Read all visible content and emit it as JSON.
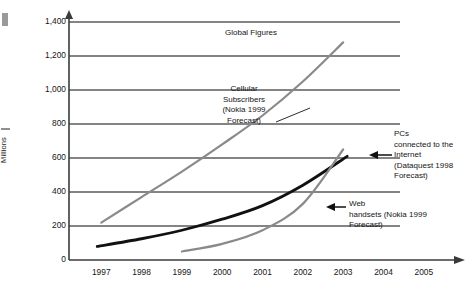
{
  "chart_data": {
    "type": "line",
    "title": "Global Figures",
    "xlabel": "",
    "ylabel": "Millions",
    "xlim": [
      1996.2,
      2005.6
    ],
    "ylim": [
      0,
      1400
    ],
    "grid": true,
    "legend_position": "inline-annotations",
    "x_ticks": [
      "1997",
      "1998",
      "1999",
      "2000",
      "2001",
      "2002",
      "2003",
      "2004",
      "2005"
    ],
    "y_ticks": [
      "1,400",
      "1,200",
      "1,000",
      "800",
      "600",
      "400",
      "200",
      "0"
    ],
    "series": [
      {
        "name": "Cellular Subscribers (Nokia 1999 Forecast)",
        "color": "#8a8a8a",
        "x": [
          1997.0,
          1998.0,
          1999.0,
          2000.0,
          2001.0,
          2002.0,
          2003.0
        ],
        "values": [
          220,
          370,
          520,
          680,
          850,
          1050,
          1280
        ]
      },
      {
        "name": "PCs connected to the Internet (Dataquest 1998 Forecast)",
        "color": "#111111",
        "x": [
          1996.9,
          1998.0,
          1999.0,
          2000.0,
          2001.0,
          2002.0,
          2003.1
        ],
        "values": [
          80,
          125,
          175,
          240,
          320,
          440,
          610
        ]
      },
      {
        "name": "Web handsets (Nokia 1999 Forecast)",
        "color": "#8a8a8a",
        "x": [
          1999.0,
          2000.0,
          2001.0,
          2002.0,
          2003.0
        ],
        "values": [
          50,
          95,
          175,
          330,
          650
        ]
      }
    ],
    "annotations": [
      {
        "id": "global",
        "text": "Global Figures"
      },
      {
        "id": "cellular",
        "text": "Cellular\nSubscribers\n(Nokia 1999\nForecast)"
      },
      {
        "id": "pcs",
        "text": "PCs\nconnected to the\nInternet\n(Dataquest 1998\nForecast)"
      },
      {
        "id": "web",
        "text": "Web\nhandsets (Nokia 1999\nForecast)"
      }
    ],
    "colors": {
      "axis": "#3a3a3a",
      "gridline": "#5b5b5b",
      "series_gray": "#8a8a8a",
      "series_black": "#111111",
      "text": "#161616",
      "background": "#ffffff"
    }
  },
  "axes": {
    "y_title": "Millions",
    "y_ticks": [
      {
        "label": "1,400",
        "value": 1400
      },
      {
        "label": "1,200",
        "value": 1200
      },
      {
        "label": "1,000",
        "value": 1000
      },
      {
        "label": "800",
        "value": 800
      },
      {
        "label": "600",
        "value": 600
      },
      {
        "label": "400",
        "value": 400
      },
      {
        "label": "200",
        "value": 200
      },
      {
        "label": "0",
        "value": 0
      }
    ],
    "x_ticks": [
      {
        "label": "1997",
        "value": 1997
      },
      {
        "label": "1998",
        "value": 1998
      },
      {
        "label": "1999",
        "value": 1999
      },
      {
        "label": "2000",
        "value": 2000
      },
      {
        "label": "2001",
        "value": 2001
      },
      {
        "label": "2002",
        "value": 2002
      },
      {
        "label": "2003",
        "value": 2003
      },
      {
        "label": "2004",
        "value": 2004
      },
      {
        "label": "2005",
        "value": 2005
      }
    ]
  },
  "annotations": {
    "global": "Global Figures",
    "cellular": "Cellular\nSubscribers\n(Nokia 1999\nForecast)",
    "pcs": "PCs\nconnected to the\nInternet\n(Dataquest 1998\nForecast)",
    "web": "Web\nhandsets (Nokia 1999\nForecast)"
  }
}
